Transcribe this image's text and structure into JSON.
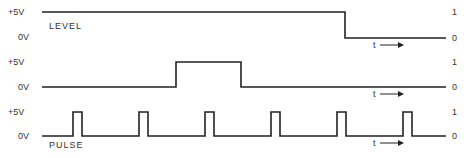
{
  "diagram": {
    "rows": [
      {
        "id": "level",
        "high_label": "+5V",
        "low_label": "0V",
        "logic_high": "1",
        "logic_low": "0",
        "name": "LEVEL",
        "time_label": "t",
        "desc": "High until mid-point then drops to low"
      },
      {
        "id": "step",
        "high_label": "+5V",
        "low_label": "0V",
        "logic_high": "1",
        "logic_low": "0",
        "name": "",
        "time_label": "t",
        "desc": "Single wide pulse"
      },
      {
        "id": "pulse",
        "high_label": "+5V",
        "low_label": "0V",
        "logic_high": "1",
        "logic_low": "0",
        "name": "PULSE",
        "time_label": "t",
        "desc": "Periodic narrow pulses"
      }
    ]
  }
}
